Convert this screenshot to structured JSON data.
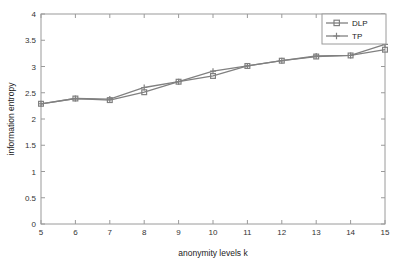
{
  "chart_data": {
    "type": "line",
    "title": "",
    "xlabel": "anonymity levels k",
    "ylabel": "information entropy",
    "x": [
      5,
      6,
      7,
      8,
      9,
      10,
      11,
      12,
      13,
      14,
      15
    ],
    "xlim": [
      5,
      15
    ],
    "ylim": [
      0,
      4
    ],
    "xticks": [
      "5",
      "6",
      "7",
      "8",
      "9",
      "10",
      "11",
      "12",
      "13",
      "14",
      "15"
    ],
    "yticks": [
      "0",
      "0.5",
      "1",
      "1.5",
      "2",
      "2.5",
      "3",
      "3.5",
      "4"
    ],
    "grid": false,
    "legend_position": "top-right",
    "series": [
      {
        "name": "DLP",
        "marker": "square",
        "color": "#808080",
        "values": [
          2.29,
          2.39,
          2.36,
          2.51,
          2.71,
          2.82,
          3.01,
          3.11,
          3.19,
          3.21,
          3.32
        ]
      },
      {
        "name": "TP",
        "marker": "plus",
        "color": "#808080",
        "values": [
          2.29,
          2.39,
          2.38,
          2.6,
          2.71,
          2.91,
          3.01,
          3.11,
          3.2,
          3.21,
          3.42
        ]
      }
    ]
  },
  "legend": {
    "entries": [
      {
        "label": "DLP"
      },
      {
        "label": "TP"
      }
    ]
  },
  "axes": {
    "x_title": "anonymity levels k",
    "y_title": "information entropy"
  },
  "colors": {
    "line": "#808080",
    "axis": "#999999",
    "text": "#333333",
    "background": "#ffffff"
  }
}
